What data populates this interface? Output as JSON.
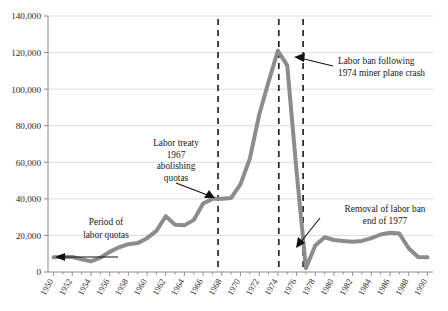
{
  "chart_data": {
    "type": "line",
    "title": "",
    "xlabel": "",
    "ylabel": "",
    "xlim": [
      1949.4,
      1990.6
    ],
    "ylim": [
      0,
      140000
    ],
    "grid": true,
    "legend_position": "none",
    "line_color": "#8c8c8c",
    "axis_color": "#8a8a8a",
    "gridline_color": "#d4d4d4",
    "annotation_color": "#1a1a1a",
    "ytick_labels": [
      "0",
      "20,000",
      "40,000",
      "60,000",
      "80,000",
      "100,000",
      "120,000",
      "140,000"
    ],
    "ytick_values": [
      0,
      20000,
      40000,
      60000,
      80000,
      100000,
      120000,
      140000
    ],
    "xtick_labels": [
      "1950",
      "1952",
      "1954",
      "1956",
      "1958",
      "1960",
      "1962",
      "1964",
      "1966",
      "1968",
      "1970",
      "1972",
      "1974",
      "1976",
      "1978",
      "1980",
      "1982",
      "1984",
      "1986",
      "1988",
      "1990"
    ],
    "xtick_values": [
      1950,
      1952,
      1954,
      1956,
      1958,
      1960,
      1962,
      1964,
      1966,
      1968,
      1970,
      1972,
      1974,
      1976,
      1978,
      1980,
      1982,
      1984,
      1986,
      1988,
      1990
    ],
    "x": [
      1950,
      1951,
      1952,
      1953,
      1954,
      1955,
      1956,
      1957,
      1958,
      1959,
      1960,
      1961,
      1962,
      1963,
      1964,
      1965,
      1966,
      1967,
      1968,
      1969,
      1970,
      1971,
      1972,
      1973,
      1974,
      1975,
      1976,
      1977,
      1978,
      1979,
      1980,
      1981,
      1982,
      1983,
      1984,
      1985,
      1986,
      1987,
      1988,
      1989,
      1990
    ],
    "values": [
      8000,
      8300,
      8200,
      7000,
      5800,
      7800,
      11000,
      13500,
      15200,
      15800,
      18500,
      22500,
      30500,
      25800,
      25500,
      28500,
      37500,
      40000,
      40000,
      40500,
      48000,
      62000,
      86000,
      104000,
      121000,
      113000,
      55000,
      2000,
      14500,
      19000,
      17500,
      17000,
      16500,
      17000,
      18500,
      20500,
      21500,
      21000,
      13000,
      8200,
      8000
    ],
    "series_name": "Labor migration flow",
    "markers": [
      {
        "name": "dashed-line-1967",
        "x": 1967.6,
        "style": "dashed-vertical"
      },
      {
        "name": "dashed-line-1974",
        "x": 1974.1,
        "style": "dashed-vertical"
      },
      {
        "name": "dashed-line-1976",
        "x": 1976.7,
        "style": "dashed-vertical"
      }
    ],
    "annotations": [
      {
        "name": "annotation-labor-quotas",
        "lines": [
          "Period of",
          "labor quotas"
        ],
        "text": "Period of labor quotas",
        "arrow": "leftward-span",
        "x": 1953.5,
        "y": 27000
      },
      {
        "name": "annotation-labor-treaty",
        "lines": [
          "Labor treaty",
          "1967",
          "abolishing",
          "quotas"
        ],
        "text": "Labor treaty 1967 abolishing quotas",
        "arrow": "to-1967-point",
        "x": 1962.5,
        "y": 62000
      },
      {
        "name": "annotation-labor-ban",
        "lines": [
          "Labor ban following",
          "1974 miner plane crash"
        ],
        "text": "Labor ban following 1974 miner plane crash",
        "arrow": "to-1976-line",
        "x": 1981,
        "y": 114000
      },
      {
        "name": "annotation-removal-ban",
        "lines": [
          "Removal of labor ban",
          "end of 1977"
        ],
        "text": "Removal of labor ban end of 1977",
        "arrow": "to-1977-trough",
        "x": 1983,
        "y": 32000
      }
    ]
  }
}
